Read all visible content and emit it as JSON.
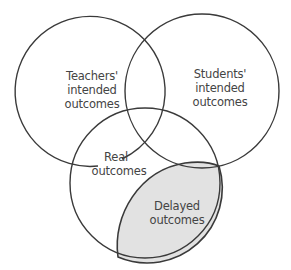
{
  "diagram": {
    "type": "venn",
    "circles": [
      {
        "id": "teachers",
        "label_lines": [
          "Teachers'",
          "intended",
          "outcomes"
        ]
      },
      {
        "id": "students",
        "label_lines": [
          "Students'",
          "intended",
          "outcomes"
        ]
      },
      {
        "id": "real",
        "label_lines": [
          "Real",
          "outcomes"
        ]
      }
    ],
    "regions": [
      {
        "id": "delayed",
        "label_lines": [
          "Delayed",
          "outcomes"
        ],
        "fill": "#e2e2e2"
      }
    ],
    "colors": {
      "stroke": "#3a3a3a",
      "text": "#444444",
      "background": "#ffffff",
      "shaded": "#e2e2e2"
    }
  }
}
